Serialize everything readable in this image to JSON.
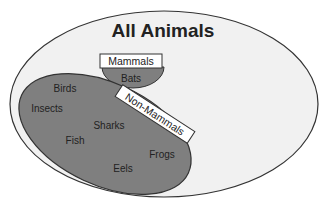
{
  "title": "All Animals",
  "sets": {
    "outer": {
      "label": "All Animals",
      "fill": "#f1f1f1",
      "stroke": "#333333"
    },
    "mammals": {
      "label": "Mammals",
      "fill": "#7f7f7f",
      "stroke": "#333333",
      "members": [
        "Bats"
      ]
    },
    "non_mammals": {
      "label": "Non-Mammals",
      "fill": "#7f7f7f",
      "stroke": "#333333",
      "members": [
        "Birds",
        "Insects",
        "Sharks",
        "Fish",
        "Frogs",
        "Eels"
      ]
    }
  },
  "items": {
    "bats": "Bats",
    "birds": "Birds",
    "insects": "Insects",
    "sharks": "Sharks",
    "fish": "Fish",
    "frogs": "Frogs",
    "eels": "Eels"
  }
}
